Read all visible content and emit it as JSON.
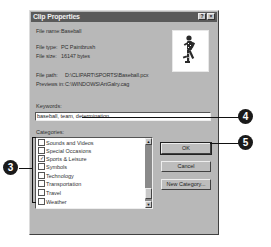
{
  "dialog": {
    "title": "Clip Properties",
    "titlebar_buttons": {
      "help": "?",
      "close": "×"
    },
    "info": {
      "file_name_label": "File name:",
      "file_name_value": "Baseball",
      "file_type_label": "File type:",
      "file_type_value": "PC Paintbrush",
      "file_size_label": "File size:",
      "file_size_value": "16147 bytes",
      "file_path_label": "File path:",
      "file_path_value": "D:\\CLIPART\\SPORTS\\Baseball.pcx",
      "previews_label": "Previews in:",
      "previews_value": "C:\\WINDOWS\\ArtGalry.cag"
    },
    "preview_icon": "baseball-player-clipart",
    "keywords": {
      "label": "Keywords:",
      "value": "baseball, team, determination"
    },
    "categories": {
      "label": "Categories:",
      "items": [
        {
          "label": "Sounds and Videos",
          "checked": false
        },
        {
          "label": "Special Occasions",
          "checked": false
        },
        {
          "label": "Sports & Leisure",
          "checked": true
        },
        {
          "label": "Symbols",
          "checked": false
        },
        {
          "label": "Technology",
          "checked": false
        },
        {
          "label": "Transportation",
          "checked": false
        },
        {
          "label": "Travel",
          "checked": false
        },
        {
          "label": "Weather",
          "checked": false
        }
      ],
      "scroll_up": "▲",
      "scroll_down": "▼"
    },
    "buttons": {
      "ok": "OK",
      "cancel": "Cancel",
      "new_category": "New Category..."
    }
  },
  "callouts": {
    "c3": "3",
    "c4": "4",
    "c5": "5"
  }
}
